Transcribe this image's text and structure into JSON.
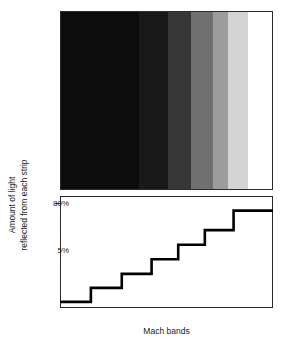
{
  "figure": {
    "title": "Mach bands",
    "xlabel": "Mach bands",
    "ylabel_line1": "Amount of light",
    "ylabel_line2": "reflected from each strip",
    "ytick_high": "80%",
    "ytick_low": "5%",
    "frame_color": "#2b2b2b",
    "line_color": "#000000",
    "background": "#ffffff"
  },
  "chart_data": {
    "type": "bar",
    "title": "Mach bands",
    "xlabel": "Mach bands",
    "ylabel": "Amount of light reflected from each strip",
    "categories": [
      "1",
      "2",
      "3",
      "4",
      "5",
      "6",
      "7"
    ],
    "values": [
      5,
      16.5,
      28,
      40,
      52,
      64,
      80
    ],
    "tick_labels": [
      "5%",
      "80%"
    ],
    "ytick_values": [
      5,
      80
    ],
    "ylim": [
      0,
      92
    ],
    "grid": false,
    "legend": null,
    "step_edges_pct": [
      0,
      14.5,
      29.0,
      43.0,
      55.5,
      68.0,
      81.5,
      100
    ],
    "step_values_pct_of_axis": [
      5,
      16.5,
      28,
      40,
      52,
      64,
      80
    ]
  },
  "bands": [
    {
      "name": "band-1-black",
      "color": "#080808",
      "width_pct": 37.0,
      "reflectance": "5%"
    },
    {
      "name": "band-2-near-black",
      "color": "#151515",
      "width_pct": 13.5,
      "reflectance": "16.5%"
    },
    {
      "name": "band-3-dark-gray",
      "color": "#333333",
      "width_pct": 11.0,
      "reflectance": "28%"
    },
    {
      "name": "band-4-mid-gray",
      "color": "#6e6e6e",
      "width_pct": 10.5,
      "reflectance": "40%"
    },
    {
      "name": "band-5-gray",
      "color": "#9b9b9b",
      "width_pct": 7.0,
      "reflectance": "52%"
    },
    {
      "name": "band-6-light-gray",
      "color": "#d3d3d3",
      "width_pct": 9.5,
      "reflectance": "64%"
    },
    {
      "name": "band-7-white",
      "color": "#ffffff",
      "width_pct": 11.5,
      "reflectance": "80%"
    }
  ]
}
